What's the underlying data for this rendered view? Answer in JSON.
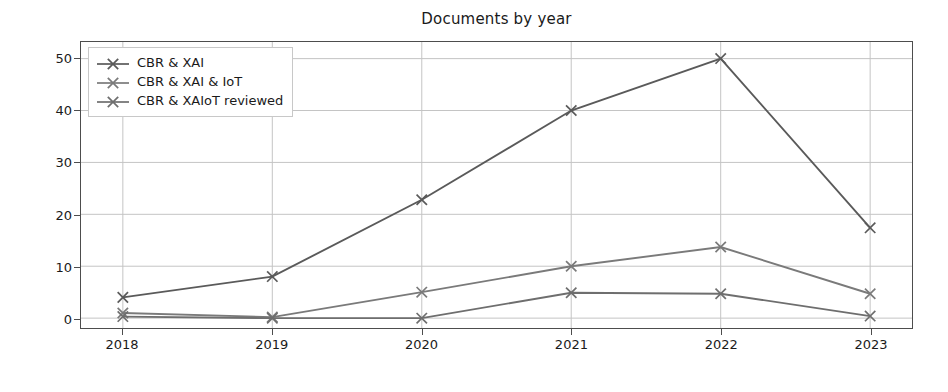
{
  "chart_data": {
    "type": "line",
    "title": "Documents by year",
    "xlabel": "",
    "ylabel": "documents",
    "categories": [
      "2018",
      "2019",
      "2020",
      "2021",
      "2022",
      "2023"
    ],
    "x": [
      2018,
      2019,
      2020,
      2021,
      2022,
      2023
    ],
    "xlim": [
      2017.72,
      2023.28
    ],
    "ylim": [
      -1.9,
      53.2
    ],
    "yticks": [
      0,
      10,
      20,
      30,
      40,
      50
    ],
    "ytick_labels": [
      "0",
      "10",
      "20",
      "30",
      "40",
      "50"
    ],
    "grid": true,
    "legend_position": "upper left",
    "marker": "x",
    "series": [
      {
        "name": "CBR & XAI",
        "color": "#5a5a5a",
        "values": [
          4.0,
          8.0,
          22.8,
          40.0,
          50.0,
          17.4
        ]
      },
      {
        "name": "CBR & XAI & IoT",
        "color": "#7a7a7a",
        "values": [
          1.0,
          0.2,
          5.0,
          10.0,
          13.7,
          4.7
        ]
      },
      {
        "name": "CBR & XAIoT reviewed",
        "color": "#6e6e6e",
        "values": [
          0.3,
          0.0,
          0.0,
          4.9,
          4.7,
          0.4
        ]
      }
    ]
  },
  "style": {
    "axis_color": "#4d4d4d",
    "grid_color": "#c4c4c4",
    "background": "#ffffff",
    "text_color": "#1a1a1a"
  }
}
